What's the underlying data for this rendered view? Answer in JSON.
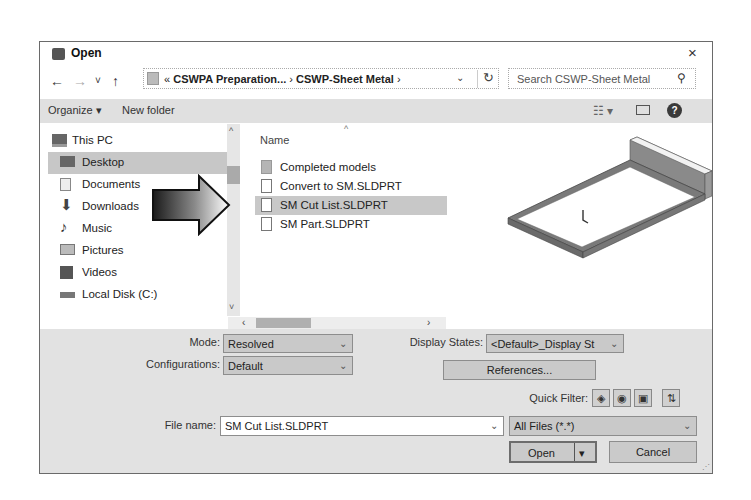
{
  "window": {
    "title": "Open",
    "close_glyph": "×"
  },
  "nav": {
    "back": "←",
    "forward": "→",
    "recent": "˅",
    "up": "↑"
  },
  "address": {
    "prefix": "« ",
    "crumbs": [
      "CSWPA Preparation...",
      "CSWP-Sheet Metal"
    ],
    "separator": " › ",
    "dropdown": "⌄",
    "refresh": "↻"
  },
  "search": {
    "placeholder": "Search CSWP-Sheet Metal",
    "icon": "⚲"
  },
  "toolbar": {
    "organize": "Organize ▾",
    "new_folder": "New folder",
    "view": "☷ ▾",
    "help": "?"
  },
  "sidebar": {
    "items": [
      {
        "label": "This PC",
        "icon": "computer-icon",
        "selected": false
      },
      {
        "label": "Desktop",
        "icon": "desktop-icon",
        "selected": true
      },
      {
        "label": "Documents",
        "icon": "documents-icon",
        "selected": false
      },
      {
        "label": "Downloads",
        "icon": "downloads-icon",
        "selected": false
      },
      {
        "label": "Music",
        "icon": "music-icon",
        "selected": false
      },
      {
        "label": "Pictures",
        "icon": "pictures-icon",
        "selected": false
      },
      {
        "label": "Videos",
        "icon": "videos-icon",
        "selected": false
      },
      {
        "label": "Local Disk (C:)",
        "icon": "drive-icon",
        "selected": false
      }
    ]
  },
  "files": {
    "column_header": "Name",
    "sort_glyph": "^",
    "rows": [
      {
        "name": "Completed models",
        "type": "folder",
        "selected": false
      },
      {
        "name": "Convert to SM.SLDPRT",
        "type": "file",
        "selected": false
      },
      {
        "name": "SM Cut List.SLDPRT",
        "type": "file",
        "selected": true
      },
      {
        "name": "SM Part.SLDPRT",
        "type": "file",
        "selected": false
      }
    ]
  },
  "scroll": {
    "up": "^",
    "down": "˅",
    "left": "‹",
    "right": "›"
  },
  "options": {
    "mode_label": "Mode:",
    "mode_value": "Resolved",
    "configurations_label": "Configurations:",
    "configurations_value": "Default",
    "display_states_label": "Display States:",
    "display_states_value": "<Default>_Display St",
    "references_button": "References...",
    "quick_filter_label": "Quick Filter:"
  },
  "filename": {
    "label": "File name:",
    "value": "SM Cut List.SLDPRT",
    "filetype": "All Files (*.*)"
  },
  "buttons": {
    "open": "Open",
    "open_split": "▾",
    "cancel": "Cancel"
  },
  "chevron": "⌄"
}
